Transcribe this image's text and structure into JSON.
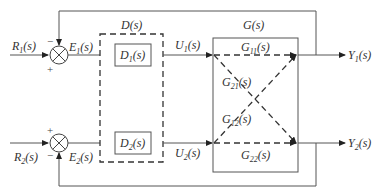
{
  "diagram": {
    "type": "MIMO decoupling control block diagram",
    "inputs": [
      {
        "id": "r1",
        "label": "R",
        "sub": "1",
        "arg": "(s)"
      },
      {
        "id": "r2",
        "label": "R",
        "sub": "2",
        "arg": "(s)"
      }
    ],
    "errors": [
      {
        "id": "e1",
        "label": "E",
        "sub": "1",
        "arg": "(s)"
      },
      {
        "id": "e2",
        "label": "E",
        "sub": "2",
        "arg": "(s)"
      }
    ],
    "summing_junctions": [
      {
        "id": "sum1",
        "top_sign": "−",
        "bottom_sign": "+"
      },
      {
        "id": "sum2",
        "top_sign": "+",
        "bottom_sign": "−"
      }
    ],
    "controller": {
      "label": "D(s)",
      "blocks": [
        {
          "id": "d1",
          "label": "D",
          "sub": "1",
          "arg": "(s)"
        },
        {
          "id": "d2",
          "label": "D",
          "sub": "2",
          "arg": "(s)"
        }
      ]
    },
    "control_signals": [
      {
        "id": "u1",
        "label": "U",
        "sub": "1",
        "arg": "(s)"
      },
      {
        "id": "u2",
        "label": "U",
        "sub": "2",
        "arg": "(s)"
      }
    ],
    "plant": {
      "label": "G(s)",
      "paths": [
        {
          "id": "g11",
          "label": "G",
          "sub": "11",
          "arg": "(s)"
        },
        {
          "id": "g21",
          "label": "G",
          "sub": "21",
          "arg": "(s)"
        },
        {
          "id": "g12",
          "label": "G",
          "sub": "12",
          "arg": "(s)"
        },
        {
          "id": "g22",
          "label": "G",
          "sub": "22",
          "arg": "(s)"
        }
      ]
    },
    "outputs": [
      {
        "id": "y1",
        "label": "Y",
        "sub": "1",
        "arg": "(s)"
      },
      {
        "id": "y2",
        "label": "Y",
        "sub": "2",
        "arg": "(s)"
      }
    ]
  }
}
